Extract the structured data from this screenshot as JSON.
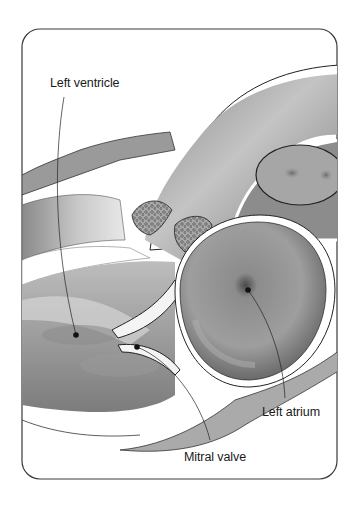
{
  "figure": {
    "labels": [
      {
        "id": "left-ventricle",
        "text": "Left ventricle",
        "x": 50,
        "y": 76,
        "dot": [
          76,
          335
        ]
      },
      {
        "id": "left-atrium",
        "text": "Left atrium",
        "x": 262,
        "y": 405,
        "dot": [
          248,
          290
        ]
      },
      {
        "id": "mitral-valve",
        "text": "Mitral valve",
        "x": 184,
        "y": 450,
        "dot": [
          137,
          347
        ]
      }
    ]
  },
  "colors": {
    "frame": "#3a3a3a",
    "background": "#ffffff",
    "tissue_dark": "#6e6e6e",
    "tissue_mid": "#9a9a9a",
    "tissue_light": "#c8c8c8",
    "leader_line": "#222222"
  }
}
